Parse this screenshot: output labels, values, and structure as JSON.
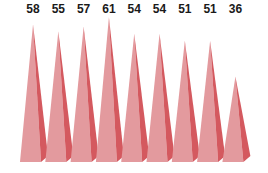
{
  "chart_data": {
    "type": "bar",
    "style": "3d-pyramid",
    "title": "",
    "xlabel": "",
    "ylabel": "",
    "categories": [
      "1",
      "2",
      "3",
      "4",
      "5",
      "6",
      "7",
      "8",
      "9"
    ],
    "values": [
      58,
      55,
      57,
      61,
      54,
      54,
      51,
      51,
      36
    ],
    "data_labels": [
      "58",
      "55",
      "57",
      "61",
      "54",
      "54",
      "51",
      "51",
      "36"
    ],
    "ylim": [
      0,
      65
    ],
    "grid": false,
    "legend": null,
    "colors": {
      "front": "#e39a9e",
      "side": "#d4595f",
      "apex_shadow": "#c9474e"
    }
  }
}
